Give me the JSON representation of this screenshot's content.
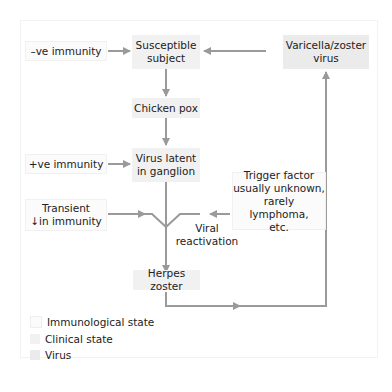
{
  "nodes": {
    "neg_immunity": "–ve immunity",
    "susceptible_1": "Susceptible",
    "susceptible_2": "subject",
    "vzv_1": "Varicella/zoster",
    "vzv_2": "virus",
    "chicken_pox": "Chicken pox",
    "pos_immunity": "+ve immunity",
    "latent_1": "Virus latent",
    "latent_2": "in ganglion",
    "transient_1": "Transient",
    "transient_2": "↓in immunity",
    "trigger_1": "Trigger factor",
    "trigger_2": "usually unknown,",
    "trigger_3": "rarely lymphoma,",
    "trigger_4": "etc.",
    "reactivation_1": "Viral",
    "reactivation_2": "reactivation",
    "herpes_zoster": "Herpes zoster"
  },
  "legend": [
    {
      "label": "Immunological state",
      "color": "#fbfbfb"
    },
    {
      "label": "Clinical state",
      "color": "#f1f1f1"
    },
    {
      "label": "Virus",
      "color": "#ebebeb"
    }
  ],
  "colors": {
    "arrow": "#9a9a9a"
  }
}
